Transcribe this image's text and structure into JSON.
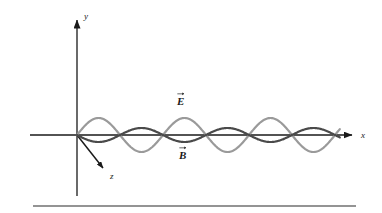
{
  "figure": {
    "title_text": "",
    "background_color": "#ffffff",
    "labels": {
      "y_axis": "y",
      "x_axis": "x",
      "z_axis": "z",
      "e_field": "E",
      "b_field": "B"
    },
    "colors": {
      "axis": "#1a1a1a",
      "e_wave": "#9a9a9a",
      "b_wave": "#4a4a4a",
      "rule": "#2b2b2b"
    }
  },
  "chart_data": {
    "type": "line",
    "xlabel": "x",
    "ylabel": "y",
    "zlabel": "z",
    "grid": false,
    "legend": "inline-annotations",
    "annotations": [
      {
        "text": "E",
        "vector": true,
        "x_px": 182,
        "y_px": 100
      },
      {
        "text": "B",
        "vector": true,
        "x_px": 184,
        "y_px": 154
      }
    ],
    "axes": {
      "origin_px": {
        "x": 77,
        "y": 135
      },
      "x_axis": {
        "from_px": {
          "x": 30,
          "y": 135
        },
        "to_px": {
          "x": 356,
          "y": 135
        },
        "arrow": "right"
      },
      "y_axis": {
        "from_px": {
          "x": 77,
          "y": 196
        },
        "to_px": {
          "x": 77,
          "y": 14
        },
        "arrow": "up"
      },
      "z_axis": {
        "from_px": {
          "x": 77,
          "y": 135
        },
        "to_px": {
          "x": 106,
          "y": 171
        },
        "arrow": "down-right"
      }
    },
    "series": [
      {
        "name": "E",
        "color": "#9a9a9a",
        "waveform": "sine",
        "amplitude_px": 17,
        "wavelength_px": 86,
        "phase_deg": 0,
        "x_start_px": 77,
        "x_end_px": 340,
        "line_width_px": 2.2,
        "peaks_px": [
          100,
          186,
          272
        ],
        "troughs_px": [
          143,
          229,
          315
        ]
      },
      {
        "name": "B",
        "color": "#4a4a4a",
        "waveform": "sine",
        "amplitude_px": 7,
        "wavelength_px": 86,
        "phase_deg": 180,
        "x_start_px": 77,
        "x_end_px": 340,
        "line_width_px": 2.2,
        "peaks_px": [
          143,
          229,
          315
        ],
        "troughs_px": [
          100,
          186,
          272
        ]
      }
    ],
    "footer_rule": {
      "from_px": {
        "x": 33,
        "y": 206
      },
      "to_px": {
        "x": 356,
        "y": 206
      }
    }
  }
}
